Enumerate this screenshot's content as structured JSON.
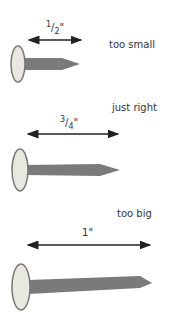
{
  "nails": [
    {
      "id": "small",
      "label": "too small",
      "dimension_num": "1",
      "dimension_den": "2",
      "dimension_unit": "\""
    },
    {
      "id": "right",
      "label": "just right",
      "dimension_num": "3",
      "dimension_den": "4",
      "dimension_unit": "\""
    },
    {
      "id": "big",
      "label": "too big",
      "dimension_whole": "1",
      "dimension_unit": "\""
    }
  ],
  "colors": {
    "shank": "#7a7a7a",
    "head_fill": "#e8e8e0",
    "head_rim": "#777777",
    "arrow": "#222222",
    "text": "#333333"
  }
}
